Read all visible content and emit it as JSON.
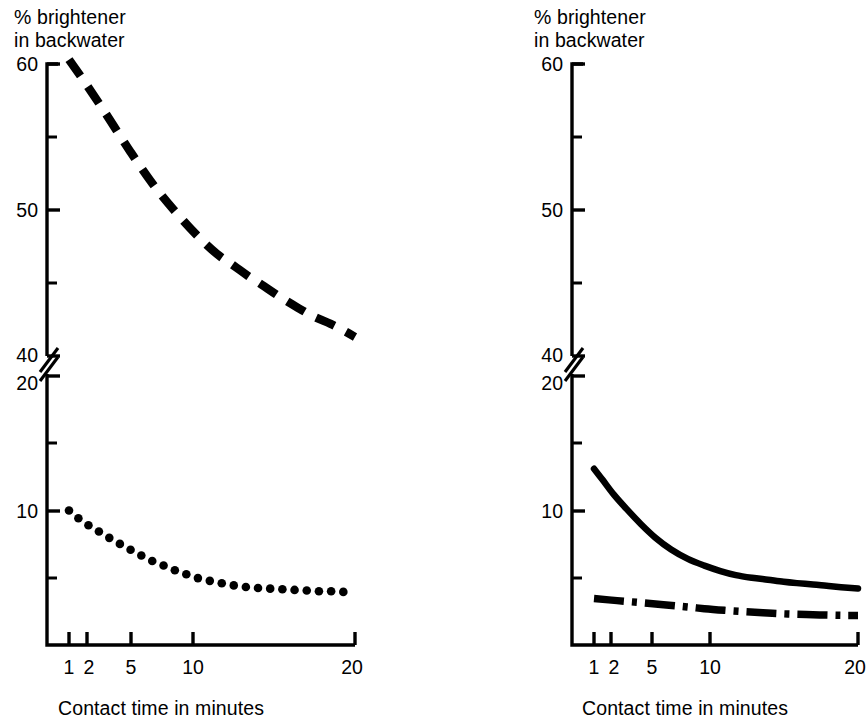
{
  "figure": {
    "background": "#ffffff",
    "ink": "#000000"
  },
  "panels": [
    {
      "id": "left",
      "y_axis_title_line1": "% brightener",
      "y_axis_title_line2": "in backwater",
      "x_axis_caption": "Contact time in minutes",
      "y_tick_labels_upper": [
        "60",
        "50",
        "40"
      ],
      "y_tick_labels_lower": [
        "20",
        "10"
      ],
      "x_tick_labels": [
        "1",
        "2",
        "5",
        "10",
        "20"
      ]
    },
    {
      "id": "right",
      "y_axis_title_line1": "% brightener",
      "y_axis_title_line2": "in backwater",
      "x_axis_caption": "Contact time in minutes",
      "y_tick_labels_upper": [
        "60",
        "50",
        "40"
      ],
      "y_tick_labels_lower": [
        "20",
        "10"
      ],
      "x_tick_labels": [
        "1",
        "2",
        "5",
        "10",
        "20"
      ]
    }
  ],
  "chart_data": [
    {
      "type": "line",
      "id": "left-chart",
      "title": "",
      "xlabel": "Contact time in minutes",
      "ylabel": "% brightener in backwater",
      "xscale": "log",
      "xlim": [
        1,
        20
      ],
      "x_ticks": [
        1,
        2,
        5,
        10,
        20
      ],
      "x_tick_labels": [
        "1",
        "2",
        "5",
        "10",
        "20"
      ],
      "y_broken_axis": true,
      "y_segment_upper": {
        "range": [
          40,
          60
        ],
        "major_ticks": [
          40,
          50,
          60
        ],
        "minor_ticks": [
          45,
          55
        ],
        "tick_labels": [
          "40",
          "50",
          "60"
        ]
      },
      "y_segment_lower": {
        "range": [
          0,
          20
        ],
        "major_ticks": [
          10,
          20
        ],
        "minor_ticks": [
          5,
          15
        ],
        "tick_labels": [
          "10",
          "20"
        ]
      },
      "grid": false,
      "legend": "none",
      "series": [
        {
          "name": "upper dashed curve",
          "style": "dashed",
          "segment": "upper",
          "x": [
            1.0,
            1.2,
            1.5,
            1.9,
            2.4,
            3.0,
            3.8,
            4.7,
            5.6,
            6.5,
            7.5,
            9.0,
            11.0,
            13.0,
            15.5,
            18.0,
            20.0
          ],
          "values": [
            60.3,
            58.6,
            56.4,
            54.0,
            51.8,
            50.0,
            48.3,
            47.0,
            46.2,
            45.5,
            44.9,
            44.1,
            43.3,
            42.7,
            42.2,
            41.7,
            41.3
          ]
        },
        {
          "name": "lower dotted curve",
          "style": "dotted",
          "segment": "lower",
          "x": [
            1.0,
            1.15,
            1.35,
            1.55,
            1.8,
            2.05,
            2.35,
            2.7,
            3.1,
            3.5,
            4.0,
            4.6,
            5.3,
            6.1,
            7.0,
            8.0,
            9.2,
            10.5,
            12.0,
            13.7,
            15.5,
            17.5,
            20.0
          ],
          "values": [
            10.0,
            9.2,
            8.5,
            7.9,
            7.3,
            6.8,
            6.3,
            5.9,
            5.5,
            5.2,
            4.9,
            4.7,
            4.5,
            4.35,
            4.25,
            4.2,
            4.15,
            4.1,
            4.05,
            4.0,
            4.0,
            3.95,
            3.95
          ]
        }
      ]
    },
    {
      "type": "line",
      "id": "right-chart",
      "title": "",
      "xlabel": "Contact time in minutes",
      "ylabel": "% brightener in backwater",
      "xscale": "log",
      "xlim": [
        1,
        20
      ],
      "x_ticks": [
        1,
        2,
        5,
        10,
        20
      ],
      "x_tick_labels": [
        "1",
        "2",
        "5",
        "10",
        "20"
      ],
      "y_broken_axis": true,
      "y_segment_upper": {
        "range": [
          40,
          60
        ],
        "major_ticks": [
          40,
          50,
          60
        ],
        "minor_ticks": [
          45,
          55
        ],
        "tick_labels": [
          "40",
          "50",
          "60"
        ]
      },
      "y_segment_lower": {
        "range": [
          0,
          20
        ],
        "major_ticks": [
          10,
          20
        ],
        "minor_ticks": [
          5,
          15
        ],
        "tick_labels": [
          "10",
          "20"
        ]
      },
      "grid": false,
      "legend": "none",
      "series": [
        {
          "name": "solid curve",
          "style": "solid",
          "segment": "lower",
          "x": [
            1.0,
            1.1,
            1.25,
            1.45,
            1.7,
            2.0,
            2.4,
            2.9,
            3.5,
            4.2,
            5.0,
            6.0,
            7.2,
            8.6,
            10.0,
            12.0,
            14.0,
            16.5,
            20.0
          ],
          "values": [
            13.1,
            12.3,
            11.2,
            10.1,
            9.0,
            8.0,
            7.1,
            6.4,
            5.9,
            5.5,
            5.2,
            5.0,
            4.85,
            4.7,
            4.6,
            4.5,
            4.4,
            4.3,
            4.2
          ]
        },
        {
          "name": "dash-dot curve",
          "style": "dash-dot",
          "segment": "lower",
          "x": [
            1.0,
            1.3,
            1.7,
            2.2,
            2.8,
            3.5,
            4.4,
            5.5,
            6.8,
            8.2,
            10.0,
            12.0,
            14.5,
            17.0,
            20.0
          ],
          "values": [
            3.45,
            3.3,
            3.15,
            3.0,
            2.85,
            2.7,
            2.58,
            2.48,
            2.4,
            2.33,
            2.28,
            2.25,
            2.22,
            2.2,
            2.2
          ]
        }
      ]
    }
  ]
}
